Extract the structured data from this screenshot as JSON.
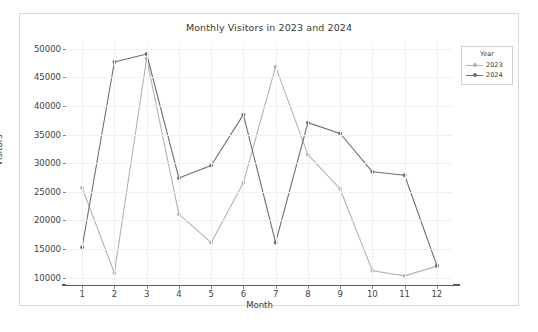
{
  "chart_data": {
    "type": "line",
    "title": "Monthly Visitors in 2023 and 2024",
    "xlabel": "Month",
    "ylabel": "Visitors",
    "categories": [
      1,
      2,
      3,
      4,
      5,
      6,
      7,
      8,
      9,
      10,
      11,
      12
    ],
    "x_tick_labels": [
      "1",
      "2",
      "3",
      "4",
      "5",
      "6",
      "7",
      "8",
      "9",
      "10",
      "11",
      "12"
    ],
    "y_tick_labels": [
      "10000",
      "15000",
      "20000",
      "25000",
      "30000",
      "35000",
      "40000",
      "45000",
      "50000"
    ],
    "y_ticks": [
      10000,
      15000,
      20000,
      25000,
      30000,
      35000,
      40000,
      45000,
      50000
    ],
    "xlim": [
      0.5,
      12.5
    ],
    "ylim": [
      8700,
      51200
    ],
    "grid": true,
    "legend_title": "Year",
    "legend_position": "upper right",
    "series": [
      {
        "name": "2023",
        "color": "#b3b3b3",
        "marker": "circle",
        "values": [
          25700,
          10800,
          48300,
          21100,
          16100,
          26600,
          46900,
          31500,
          25500,
          11200,
          10300,
          12000
        ]
      },
      {
        "name": "2024",
        "color": "#6e6e6e",
        "marker": "circle",
        "values": [
          15300,
          47700,
          49100,
          27400,
          29600,
          38500,
          16100,
          37100,
          35200,
          28500,
          27900,
          12100
        ]
      }
    ]
  },
  "legend": {
    "title": "Year",
    "entries": [
      {
        "label": "2023"
      },
      {
        "label": "2024"
      }
    ]
  },
  "colors": {
    "series_2023": "#b3b3b3",
    "series_2024": "#6e6e6e",
    "grid": "#eef1f4",
    "axis": "#8d8d8d",
    "bottom_spine": "#5a5a5a",
    "text": "#3a3a3a",
    "frame": "#d9d9d9",
    "background": "#ffffff"
  }
}
